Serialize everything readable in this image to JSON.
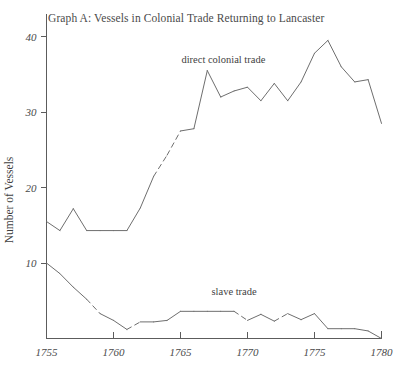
{
  "chart_data": {
    "type": "line",
    "title": "Graph A: Vessels in Colonial Trade Returning to Lancaster",
    "xlabel": "",
    "ylabel": "Number of Vessels",
    "xlim": [
      1755,
      1780
    ],
    "ylim": [
      0,
      43
    ],
    "xticks": [
      1755,
      1760,
      1765,
      1770,
      1775,
      1780
    ],
    "xtick_labels": [
      "1755",
      "1760",
      "1765",
      "1770",
      "1775",
      "1780"
    ],
    "yticks": [
      10,
      20,
      30,
      40
    ],
    "ytick_labels": [
      "10",
      "20",
      "30",
      "40"
    ],
    "grid": false,
    "legend_position": "inline-annotation",
    "series": [
      {
        "name": "direct colonial trade",
        "label_x": 1768.2,
        "label_y": 36.5,
        "color": "#6e6e6e",
        "x": [
          1755,
          1756,
          1757,
          1758,
          1759,
          1760,
          1761,
          1762,
          1763,
          1764,
          1765,
          1766,
          1767,
          1768,
          1769,
          1770,
          1771,
          1772,
          1773,
          1774,
          1775,
          1776,
          1777,
          1778,
          1779,
          1780
        ],
        "values": [
          15.5,
          14.3,
          17.2,
          14.3,
          14.3,
          14.3,
          14.3,
          17.3,
          21.5,
          24.3,
          27.5,
          27.8,
          35.5,
          32.0,
          32.8,
          33.3,
          31.5,
          33.8,
          31.5,
          34.0,
          37.8,
          39.5,
          36.0,
          34.0,
          34.3,
          28.5
        ],
        "dashed_segments": [
          [
            1763,
            1764
          ],
          [
            1764,
            1765
          ]
        ]
      },
      {
        "name": "slave trade",
        "label_x": 1769.0,
        "label_y": 5.8,
        "color": "#6e6e6e",
        "x": [
          1755,
          1756,
          1757,
          1758,
          1759,
          1760,
          1761,
          1762,
          1763,
          1764,
          1765,
          1766,
          1767,
          1768,
          1769,
          1770,
          1771,
          1772,
          1773,
          1774,
          1775,
          1776,
          1777,
          1778,
          1779,
          1780
        ],
        "values": [
          10.0,
          8.6,
          6.8,
          5.2,
          3.3,
          2.4,
          1.2,
          2.2,
          2.2,
          2.4,
          3.6,
          3.6,
          3.6,
          3.6,
          3.6,
          2.4,
          3.2,
          2.3,
          3.3,
          2.5,
          3.3,
          1.3,
          1.3,
          1.3,
          1.0,
          0.0
        ],
        "dashed_segments": [
          [
            1758,
            1759
          ],
          [
            1761,
            1762
          ],
          [
            1769,
            1770
          ],
          [
            1772,
            1773
          ]
        ]
      }
    ]
  },
  "axes": {
    "y_axis_title": "Number of Vessels"
  }
}
